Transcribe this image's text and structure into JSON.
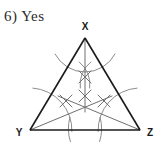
{
  "page": {
    "background_color": "#ffffff",
    "width": 162,
    "height": 152
  },
  "answer": {
    "number": "6)",
    "response": "Yes",
    "full_text": "6)  Yes"
  },
  "figure": {
    "kind": "geometry-construction",
    "colors": {
      "triangle_stroke": "#1a1a1a",
      "arc_stroke": "#8c8c8c",
      "bisector_stroke": "#707070",
      "label_fill": "#1a1a1a"
    },
    "vertices": [
      {
        "name": "X",
        "label": "X",
        "x": 85,
        "y": 38,
        "label_x": 85,
        "label_y": 28
      },
      {
        "name": "Y",
        "label": "Y",
        "x": 30,
        "y": 130,
        "label_x": 19,
        "label_y": 136
      },
      {
        "name": "Z",
        "label": "Z",
        "x": 140,
        "y": 130,
        "label_x": 150,
        "label_y": 136
      }
    ],
    "sides": [
      {
        "name": "XY",
        "from": "X",
        "to": "Y"
      },
      {
        "name": "XZ",
        "from": "X",
        "to": "Z"
      },
      {
        "name": "YZ",
        "from": "Y",
        "to": "Z"
      }
    ],
    "incenter": {
      "x": 85,
      "y": 101
    },
    "bisectors": [
      {
        "name": "bisector-from-x",
        "from": "X",
        "x1": 85,
        "y1": 38,
        "x2": 85,
        "y2": 112
      },
      {
        "name": "bisector-from-y",
        "from": "Y",
        "x1": 30,
        "y1": 130,
        "x2": 112,
        "y2": 96
      },
      {
        "name": "bisector-from-z",
        "from": "Z",
        "x1": 140,
        "y1": 130,
        "x2": 58,
        "y2": 96
      }
    ],
    "arcs": [
      {
        "name": "arc-centered-x",
        "cx": 85,
        "cy": 38,
        "r": 34,
        "start_deg": 28,
        "end_deg": 152
      },
      {
        "name": "arc-centered-y",
        "cx": 30,
        "cy": 130,
        "r": 42,
        "start_deg": -86,
        "end_deg": 2
      },
      {
        "name": "arc-centered-z",
        "cx": 140,
        "cy": 130,
        "r": 42,
        "start_deg": 178,
        "end_deg": 266
      },
      {
        "name": "arc-small-left-of-x",
        "cx": 62,
        "cy": 84,
        "r": 28,
        "start_deg": -52,
        "end_deg": 8
      },
      {
        "name": "arc-small-right-of-x",
        "cx": 108,
        "cy": 84,
        "r": 28,
        "start_deg": 172,
        "end_deg": 232
      },
      {
        "name": "arc-below-base-left",
        "cx": 30,
        "cy": 130,
        "r": 42,
        "start_deg": -16,
        "end_deg": 18
      },
      {
        "name": "arc-below-base-right",
        "cx": 140,
        "cy": 130,
        "r": 42,
        "start_deg": 162,
        "end_deg": 196
      }
    ],
    "intersection_marks": [
      {
        "name": "mark-upper-center",
        "x": 85,
        "y": 77
      },
      {
        "name": "mark-center",
        "x": 85,
        "y": 96
      },
      {
        "name": "mark-left",
        "x": 66,
        "y": 101
      },
      {
        "name": "mark-right",
        "x": 104,
        "y": 101
      }
    ]
  }
}
